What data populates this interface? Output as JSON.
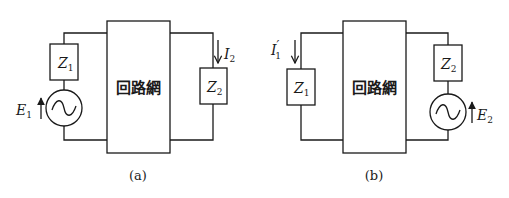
{
  "figure": {
    "colors": {
      "line": "#1a1a1a",
      "background": "#ffffff"
    },
    "circuit_a": {
      "caption": "(a)",
      "network_label": "回路網",
      "z1": {
        "sym": "Z",
        "sub": "1"
      },
      "z2": {
        "sym": "Z",
        "sub": "2"
      },
      "source": {
        "sym": "E",
        "sub": "1",
        "icon": "ac-source-icon"
      },
      "current": {
        "sym": "I",
        "sub": "2",
        "prime": ""
      }
    },
    "circuit_b": {
      "caption": "(b)",
      "network_label": "回路網",
      "z1": {
        "sym": "Z",
        "sub": "1"
      },
      "z2": {
        "sym": "Z",
        "sub": "2"
      },
      "source": {
        "sym": "E",
        "sub": "2",
        "icon": "ac-source-icon"
      },
      "current": {
        "sym": "I",
        "sub": "1",
        "prime": "′"
      }
    }
  }
}
